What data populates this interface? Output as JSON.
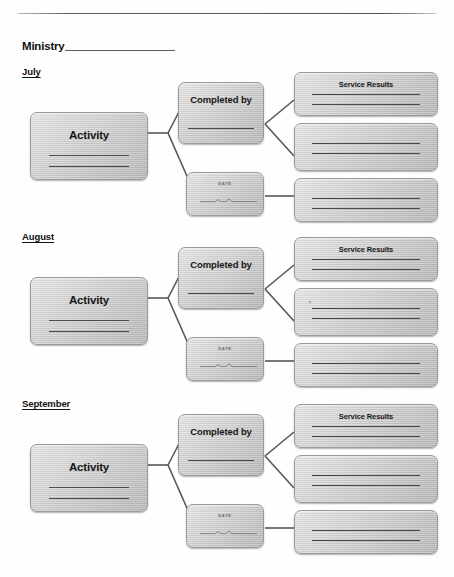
{
  "header": {
    "ministry_label": "Ministry",
    "ministry_blank_value": ""
  },
  "sections": [
    {
      "month": "July",
      "activity": {
        "title": "Activity"
      },
      "completed_by": {
        "title": "Completed by"
      },
      "date": {
        "title": "DATE"
      },
      "results": [
        {
          "title": "Service Results",
          "has_title": true
        },
        {
          "title": "",
          "has_title": false
        },
        {
          "title": "",
          "has_title": false
        }
      ]
    },
    {
      "month": "August",
      "activity": {
        "title": "Activity"
      },
      "completed_by": {
        "title": "Completed by"
      },
      "date": {
        "title": "DATE"
      },
      "results": [
        {
          "title": "Service Results",
          "has_title": true
        },
        {
          "title": "",
          "has_title": false
        },
        {
          "title": "",
          "has_title": false
        }
      ]
    },
    {
      "month": "September",
      "activity": {
        "title": "Activity"
      },
      "completed_by": {
        "title": "Completed by"
      },
      "date": {
        "title": "DATE"
      },
      "results": [
        {
          "title": "Service Results",
          "has_title": true
        },
        {
          "title": "",
          "has_title": false
        },
        {
          "title": "",
          "has_title": false
        }
      ]
    }
  ]
}
